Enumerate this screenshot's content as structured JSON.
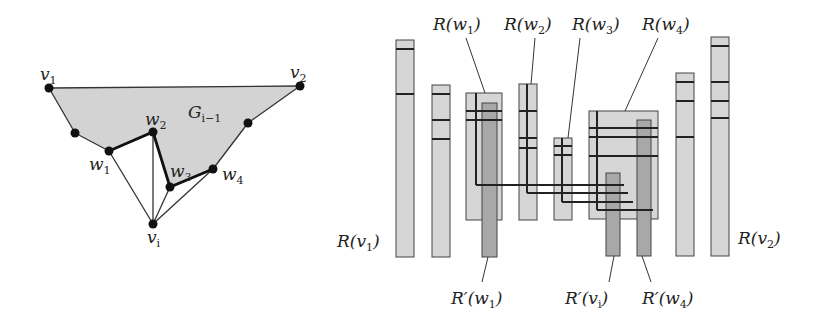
{
  "figure": {
    "left_graph": {
      "fill_color": "#d3d3d3",
      "region_label": {
        "base": "G",
        "sub": "i−1"
      },
      "vertices": [
        {
          "id": "v1",
          "base": "v",
          "sub": "1",
          "x": 49,
          "y": 88
        },
        {
          "id": "v2",
          "base": "v",
          "sub": "2",
          "x": 300,
          "y": 86
        },
        {
          "id": "a",
          "base": "",
          "sub": "",
          "x": 75,
          "y": 133
        },
        {
          "id": "w1",
          "base": "w",
          "sub": "1",
          "x": 109,
          "y": 151
        },
        {
          "id": "w2",
          "base": "w",
          "sub": "2",
          "x": 153,
          "y": 132
        },
        {
          "id": "w3",
          "base": "w",
          "sub": "3",
          "x": 170,
          "y": 187
        },
        {
          "id": "w4",
          "base": "w",
          "sub": "4",
          "x": 213,
          "y": 169
        },
        {
          "id": "b",
          "base": "",
          "sub": "",
          "x": 248,
          "y": 123
        },
        {
          "id": "vi",
          "base": "v",
          "sub": "i",
          "x": 153,
          "y": 224
        }
      ]
    },
    "right_labels": {
      "R_v1": "R(v",
      "R_v1_sub": "1",
      "R_v2": "R(v",
      "R_v2_sub": "2",
      "R_w1": "R(w",
      "R_w1_sub": "1",
      "R_w2": "R(w",
      "R_w2_sub": "2",
      "R_w3": "R(w",
      "R_w3_sub": "3",
      "R_w4": "R(w",
      "R_w4_sub": "4",
      "Rp_w1": "R′(w",
      "Rp_w1_sub": "1",
      "Rp_vi": "R′(v",
      "Rp_vi_sub": "i",
      "Rp_w4": "R′(w",
      "Rp_w4_sub": "4",
      "close": ")"
    },
    "colors": {
      "light_bar": "#d6d6d6",
      "dark_bar": "#a8a8a8",
      "stroke": "#222222"
    }
  }
}
